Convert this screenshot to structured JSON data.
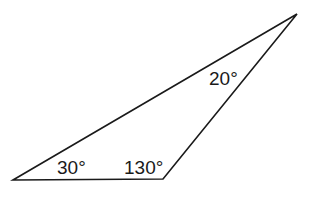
{
  "diagram": {
    "type": "triangle",
    "stroke_color": "#1a1a1a",
    "background": "#ffffff",
    "vertices": {
      "bottom_left": [
        13,
        180
      ],
      "bottom_right": [
        163,
        179
      ],
      "top_right": [
        297,
        14
      ]
    },
    "angles": [
      {
        "label": "30°",
        "vertex": "bottom_left",
        "x": 57,
        "y": 158
      },
      {
        "label": "130°",
        "vertex": "bottom_right",
        "x": 124,
        "y": 158
      },
      {
        "label": "20°",
        "vertex": "top_right",
        "x": 209,
        "y": 69
      }
    ]
  }
}
